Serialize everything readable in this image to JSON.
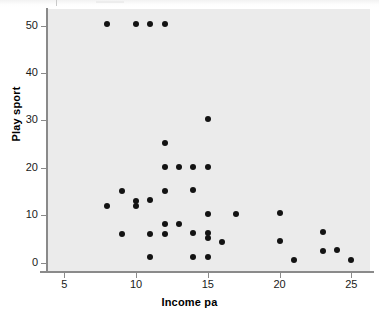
{
  "chart_data": {
    "type": "scatter",
    "title": "",
    "xlabel": "Income pa",
    "ylabel": "Play sport",
    "xlim": [
      3.8,
      26.3
    ],
    "ylim": [
      -2.0,
      53.5
    ],
    "xticks": [
      5,
      10,
      15,
      20,
      25
    ],
    "yticks": [
      0,
      10,
      20,
      30,
      40,
      50
    ],
    "grid": false,
    "legend": null,
    "marker": "filled-circle",
    "marker_color": "#131313",
    "plot_background": "#ebebeb",
    "figure_background": "#ffffff",
    "points": [
      {
        "x": 8,
        "y": 50.3
      },
      {
        "x": 10,
        "y": 50.3
      },
      {
        "x": 11,
        "y": 50.3
      },
      {
        "x": 12,
        "y": 50.3
      },
      {
        "x": 15,
        "y": 30.3
      },
      {
        "x": 12,
        "y": 25.3
      },
      {
        "x": 12,
        "y": 20.2
      },
      {
        "x": 13,
        "y": 20.2
      },
      {
        "x": 14,
        "y": 20.2
      },
      {
        "x": 15,
        "y": 20.2
      },
      {
        "x": 9,
        "y": 15.0
      },
      {
        "x": 12,
        "y": 15.1
      },
      {
        "x": 14,
        "y": 15.2
      },
      {
        "x": 10,
        "y": 13.0
      },
      {
        "x": 11,
        "y": 13.1
      },
      {
        "x": 10,
        "y": 12.0
      },
      {
        "x": 8,
        "y": 11.9
      },
      {
        "x": 15,
        "y": 10.2
      },
      {
        "x": 17,
        "y": 10.3
      },
      {
        "x": 20,
        "y": 10.4
      },
      {
        "x": 12,
        "y": 8.1
      },
      {
        "x": 13,
        "y": 8.2
      },
      {
        "x": 23,
        "y": 6.5
      },
      {
        "x": 9,
        "y": 6.0
      },
      {
        "x": 11,
        "y": 6.1
      },
      {
        "x": 12,
        "y": 6.1
      },
      {
        "x": 14,
        "y": 6.3
      },
      {
        "x": 15,
        "y": 6.3
      },
      {
        "x": 15,
        "y": 5.2
      },
      {
        "x": 20,
        "y": 4.5
      },
      {
        "x": 16,
        "y": 4.3
      },
      {
        "x": 23,
        "y": 2.5
      },
      {
        "x": 24,
        "y": 2.6
      },
      {
        "x": 11,
        "y": 1.1
      },
      {
        "x": 14,
        "y": 1.2
      },
      {
        "x": 15,
        "y": 1.2
      },
      {
        "x": 21,
        "y": 0.5
      },
      {
        "x": 25,
        "y": 0.6
      }
    ]
  },
  "axes": {
    "x_tick_labels": [
      "5",
      "10",
      "15",
      "20",
      "25"
    ],
    "y_tick_labels": [
      "0",
      "10",
      "20",
      "30",
      "40",
      "50"
    ],
    "x_axis_title": "Income pa",
    "y_axis_title": "Play sport"
  }
}
